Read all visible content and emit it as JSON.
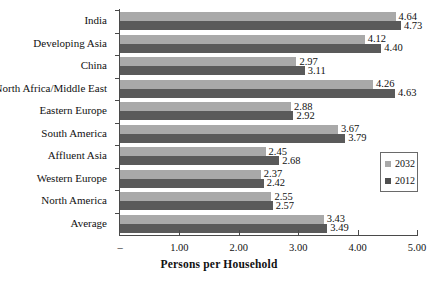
{
  "chart_data": {
    "type": "bar",
    "orientation": "horizontal",
    "title": "",
    "xlabel": "Persons per Household",
    "ylabel": "",
    "xlim": [
      0,
      5
    ],
    "xticks": [
      "–",
      "1.00",
      "2.00",
      "3.00",
      "4.00",
      "5.00"
    ],
    "xtick_values": [
      0,
      1,
      2,
      3,
      4,
      5
    ],
    "grid": false,
    "legend_position": "right",
    "categories": [
      "India",
      "Developing Asia",
      "China",
      "North Africa/Middle East",
      "Eastern Europe",
      "South America",
      "Affluent Asia",
      "Western Europe",
      "North America",
      "Average"
    ],
    "series": [
      {
        "name": "2032",
        "color": "#a9a9a9",
        "values": [
          4.64,
          4.12,
          2.97,
          4.26,
          2.88,
          3.67,
          2.45,
          2.37,
          2.55,
          3.43
        ],
        "labels": [
          "4.64",
          "4.12",
          "2.97",
          "4.26",
          "2.88",
          "3.67",
          "2.45",
          "2.37",
          "2.55",
          "3.43"
        ]
      },
      {
        "name": "2012",
        "color": "#5a5a5a",
        "values": [
          4.73,
          4.4,
          3.11,
          4.63,
          2.92,
          3.79,
          2.68,
          2.42,
          2.57,
          3.49
        ],
        "labels": [
          "4.73",
          "4.40",
          "3.11",
          "4.63",
          "2.92",
          "3.79",
          "2.68",
          "2.42",
          "2.57",
          "3.49"
        ]
      }
    ]
  },
  "legend": {
    "items": [
      {
        "label": "2032",
        "color": "#a9a9a9"
      },
      {
        "label": "2012",
        "color": "#4f4f4f"
      }
    ]
  }
}
